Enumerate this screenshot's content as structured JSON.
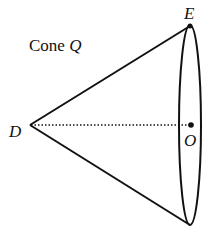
{
  "diagram": {
    "title_text": "Cone ",
    "title_var": "Q",
    "points": {
      "apex": {
        "label": "D",
        "x": 30,
        "y": 125
      },
      "top": {
        "label": "E",
        "x": 190,
        "y": 26
      },
      "bottom": {
        "label": "",
        "x": 190,
        "y": 225
      },
      "center": {
        "label": "O",
        "x": 191,
        "y": 125
      }
    },
    "base_ellipse": {
      "cx": 190,
      "cy": 125,
      "rx": 11,
      "ry": 100
    },
    "colors": {
      "stroke": "#111111",
      "background": "#ffffff"
    }
  }
}
